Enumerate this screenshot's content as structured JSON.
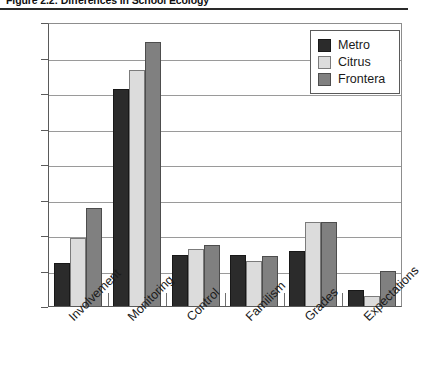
{
  "figure": {
    "title": "Figure 2.2: Differences in School Ecology"
  },
  "legend": {
    "position": "top-right",
    "entries": [
      {
        "label": "Metro",
        "color": "#2b2b2b"
      },
      {
        "label": "Citrus",
        "color": "#dcdcdc"
      },
      {
        "label": "Frontera",
        "color": "#808080"
      }
    ]
  },
  "axis": {
    "y_ticks": [
      "4.00",
      "3.75",
      "3.50",
      "3.25",
      "3.00",
      "2.75",
      "2.50",
      "2.25",
      "2.00"
    ]
  },
  "chart_data": {
    "type": "bar",
    "title": "Figure 2.2: Differences in School Ecology",
    "xlabel": "",
    "ylabel": "",
    "ylim": [
      2.0,
      4.0
    ],
    "ytick_step": 0.25,
    "grid": true,
    "legend_position": "top-right",
    "categories": [
      "Involvement",
      "Monitoring",
      "Control",
      "Familism",
      "Grades",
      "Expectations"
    ],
    "series": [
      {
        "name": "Metro",
        "color": "#2b2b2b",
        "values": [
          2.3,
          3.53,
          2.36,
          2.36,
          2.39,
          2.11
        ]
      },
      {
        "name": "Citrus",
        "color": "#dcdcdc",
        "values": [
          2.48,
          3.66,
          2.4,
          2.32,
          2.59,
          2.07
        ]
      },
      {
        "name": "Frontera",
        "color": "#808080",
        "values": [
          2.69,
          3.86,
          2.43,
          2.35,
          2.59,
          2.25
        ]
      }
    ]
  }
}
